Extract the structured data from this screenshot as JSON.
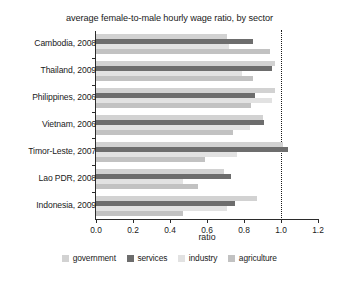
{
  "chart_data": {
    "type": "bar",
    "orientation": "horizontal",
    "title": "average female-to-male hourly wage ratio, by sector",
    "xlabel": "ratio",
    "ylabel": "",
    "xlim": [
      0.0,
      1.2
    ],
    "xticks": [
      "0.0",
      "0.2",
      "0.4",
      "0.6",
      "0.8",
      "1.0",
      "1.2"
    ],
    "xtick_values": [
      0.0,
      0.2,
      0.4,
      0.6,
      0.8,
      1.0,
      1.2
    ],
    "grid": false,
    "legend_position": "bottom",
    "reference_line": 1.0,
    "categories": [
      "Cambodia, 2008",
      "Thailand, 2009",
      "Philippines, 2006",
      "Vietnam, 2006",
      "Timor-Leste, 2007",
      "Lao PDR, 2008",
      "Indonesia, 2009"
    ],
    "series": [
      {
        "name": "government",
        "color": "#d2d2d2",
        "values": [
          0.71,
          0.97,
          0.97,
          0.9,
          1.01,
          0.69,
          0.87
        ]
      },
      {
        "name": "services",
        "color": "#6d6d6d",
        "values": [
          0.85,
          0.95,
          0.86,
          0.91,
          1.04,
          0.73,
          0.75
        ]
      },
      {
        "name": "industry",
        "color": "#e2e2e2",
        "values": [
          0.72,
          0.79,
          0.95,
          0.83,
          0.76,
          0.47,
          0.71
        ]
      },
      {
        "name": "agriculture",
        "color": "#c2c2c2",
        "values": [
          0.94,
          0.85,
          0.84,
          0.74,
          0.59,
          0.55,
          0.47
        ]
      }
    ]
  }
}
